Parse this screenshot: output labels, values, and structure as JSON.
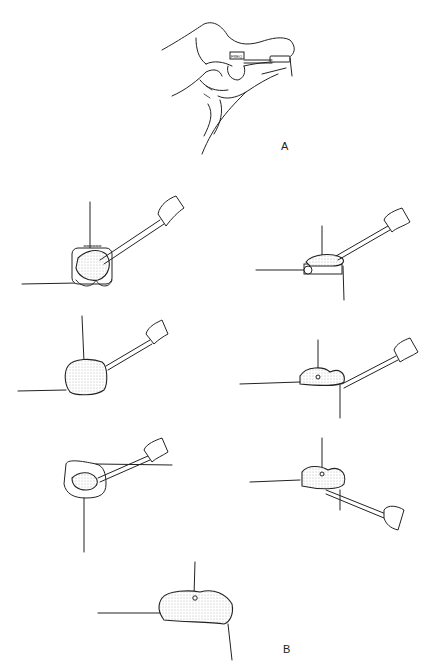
{
  "figure": {
    "labels": {
      "a": "A",
      "b": "B"
    },
    "device_tag": "FREQ",
    "panels": [
      {
        "id": "A",
        "description": "hand holding hearing aid with FREQ control"
      },
      {
        "id": "B1",
        "description": "tool applied to device, front view"
      },
      {
        "id": "B2",
        "description": "tool applied to device, side view"
      },
      {
        "id": "B3",
        "description": "impression material, front view"
      },
      {
        "id": "B4",
        "description": "impression material, side view"
      },
      {
        "id": "B5",
        "description": "tool scooping material from shell"
      },
      {
        "id": "B6",
        "description": "tool under material, side view"
      },
      {
        "id": "B7",
        "description": "final impression shape"
      }
    ],
    "colors": {
      "line": "#222222",
      "background": "#ffffff"
    }
  }
}
